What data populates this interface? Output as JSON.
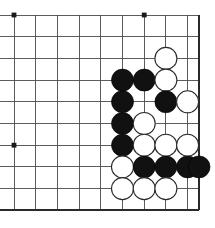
{
  "figure": {
    "kind": "go-board-diagram",
    "board_size_shown": {
      "columns": 10,
      "rows": 10
    },
    "colors": {
      "background": "#ffffff",
      "grid_line": "#4a4a4a",
      "edge_line": "#2a2a2a",
      "black_stone": "#111111",
      "white_stone": "#ffffff",
      "stone_outline": "#2a2a2a",
      "star_point": "#1a1a1a"
    }
  },
  "geometry": {
    "origin_x": 14,
    "origin_y": 15,
    "spacing": 21.7,
    "stone_radius": 11,
    "star_radius": 2.4,
    "columns": 10,
    "rows": 10,
    "right_edge_x": 199,
    "bottom_edge_y": 210,
    "line_columns": [
      14,
      35.7,
      57.4,
      79.1,
      100.8,
      122.5,
      144.2,
      165.9,
      187.6,
      199
    ],
    "line_rows": [
      15,
      36.7,
      58.4,
      80.1,
      101.8,
      123.5,
      145.2,
      166.9,
      188.6,
      210.3
    ]
  },
  "star_points": [
    {
      "col": 0,
      "row": 0
    },
    {
      "col": 6,
      "row": 0
    },
    {
      "col": 0,
      "row": 6
    }
  ],
  "stones": [
    {
      "color": "white",
      "col": 7,
      "row": 2
    },
    {
      "color": "black",
      "col": 5,
      "row": 3
    },
    {
      "color": "black",
      "col": 6,
      "row": 3
    },
    {
      "color": "white",
      "col": 7,
      "row": 3
    },
    {
      "color": "black",
      "col": 5,
      "row": 4
    },
    {
      "color": "black",
      "col": 7,
      "row": 4
    },
    {
      "color": "white",
      "col": 8,
      "row": 4
    },
    {
      "color": "black",
      "col": 5,
      "row": 5
    },
    {
      "color": "white",
      "col": 6,
      "row": 5
    },
    {
      "color": "black",
      "col": 5,
      "row": 6
    },
    {
      "color": "white",
      "col": 6,
      "row": 6
    },
    {
      "color": "white",
      "col": 7,
      "row": 6
    },
    {
      "color": "white",
      "col": 8,
      "row": 6
    },
    {
      "color": "white",
      "col": 5,
      "row": 7
    },
    {
      "color": "black",
      "col": 6,
      "row": 7
    },
    {
      "color": "black",
      "col": 7,
      "row": 7
    },
    {
      "color": "black",
      "col": 8,
      "row": 7
    },
    {
      "color": "black",
      "col": 9,
      "row": 7
    },
    {
      "color": "white",
      "col": 5,
      "row": 8
    },
    {
      "color": "white",
      "col": 6,
      "row": 8
    },
    {
      "color": "white",
      "col": 7,
      "row": 8
    }
  ],
  "counts": {
    "black_stones": 11,
    "white_stones": 10,
    "total_stones": 21
  }
}
